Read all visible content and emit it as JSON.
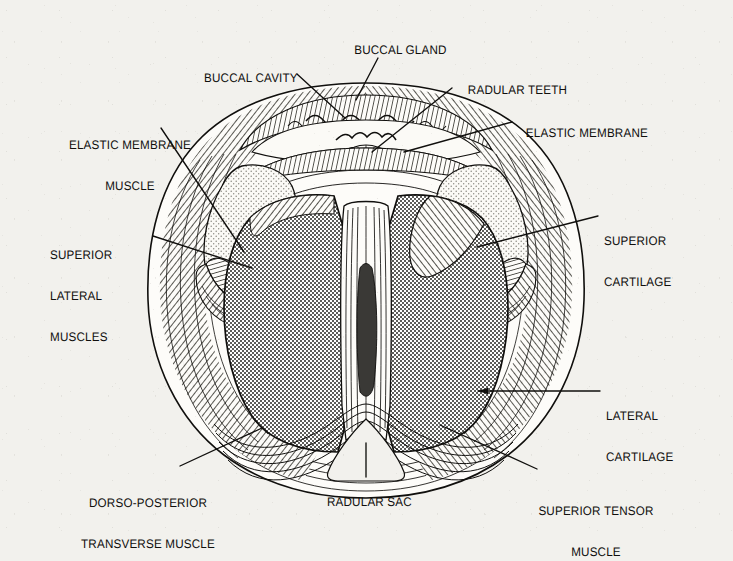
{
  "figure": {
    "background_color": "#f2f1ed",
    "ink_color": "#100f0d",
    "cartilage_fill": "#b9b9b6",
    "superior_cartilage_fill": "#e8e7e2"
  },
  "labels": [
    {
      "id": "buccal-cavity",
      "text": "BUCCAL CAVITY",
      "lines": [
        "BUCCAL CAVITY"
      ]
    },
    {
      "id": "buccal-gland",
      "text": "BUCCAL GLAND",
      "lines": [
        "BUCCAL GLAND"
      ]
    },
    {
      "id": "radular-teeth",
      "text": "RADULAR TEETH",
      "lines": [
        "RADULAR TEETH"
      ]
    },
    {
      "id": "elastic-membrane-right",
      "text": "ELASTIC MEMBRANE",
      "lines": [
        "ELASTIC MEMBRANE"
      ]
    },
    {
      "id": "elastic-membrane-muscle",
      "text": "ELASTIC MEMBRANE MUSCLE",
      "lines": [
        "ELASTIC MEMBRANE",
        "MUSCLE"
      ]
    },
    {
      "id": "superior-lateral-muscles",
      "text": "SUPERIOR LATERAL MUSCLES",
      "lines": [
        "SUPERIOR",
        "LATERAL",
        "MUSCLES"
      ]
    },
    {
      "id": "superior-cartilage",
      "text": "SUPERIOR CARTILAGE",
      "lines": [
        "SUPERIOR",
        "CARTILAGE"
      ]
    },
    {
      "id": "lateral-cartilage",
      "text": "LATERAL CARTILAGE",
      "lines": [
        "LATERAL",
        "CARTILAGE"
      ]
    },
    {
      "id": "dorso-posterior-transverse-muscle",
      "text": "DORSO-POSTERIOR TRANSVERSE MUSCLE",
      "lines": [
        "DORSO-POSTERIOR",
        "TRANSVERSE MUSCLE"
      ]
    },
    {
      "id": "radular-sac",
      "text": "RADULAR SAC",
      "lines": [
        "RADULAR SAC"
      ]
    },
    {
      "id": "superior-tensor-muscle",
      "text": "SUPERIOR TENSOR MUSCLE",
      "lines": [
        "SUPERIOR TENSOR",
        "MUSCLE"
      ]
    }
  ],
  "label_text": {
    "buccal_cavity": "BUCCAL CAVITY",
    "buccal_gland": "BUCCAL GLAND",
    "radular_teeth": "RADULAR TEETH",
    "elastic_membrane_right": "ELASTIC MEMBRANE",
    "elastic_membrane_muscle_l1": "ELASTIC MEMBRANE",
    "elastic_membrane_muscle_l2": "MUSCLE",
    "superior_lateral_l1": "SUPERIOR",
    "superior_lateral_l2": "LATERAL",
    "superior_lateral_l3": "MUSCLES",
    "superior_cartilage_l1": "SUPERIOR",
    "superior_cartilage_l2": "CARTILAGE",
    "lateral_cartilage_l1": "LATERAL",
    "lateral_cartilage_l2": "CARTILAGE",
    "dorso_posterior_l1": "DORSO-POSTERIOR",
    "dorso_posterior_l2": "TRANSVERSE MUSCLE",
    "radular_sac": "RADULAR SAC",
    "superior_tensor_l1": "SUPERIOR TENSOR",
    "superior_tensor_l2": "MUSCLE"
  }
}
